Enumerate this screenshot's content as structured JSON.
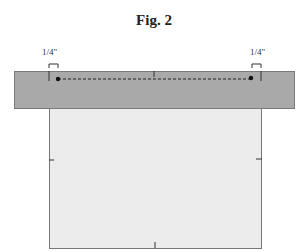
{
  "figure": {
    "title": "Fig. 2",
    "left_measure": "1/4\"",
    "right_measure": "1/4\"",
    "colors": {
      "strip": "#a9a9a9",
      "panel": "#ececec",
      "line": "#222222"
    }
  }
}
